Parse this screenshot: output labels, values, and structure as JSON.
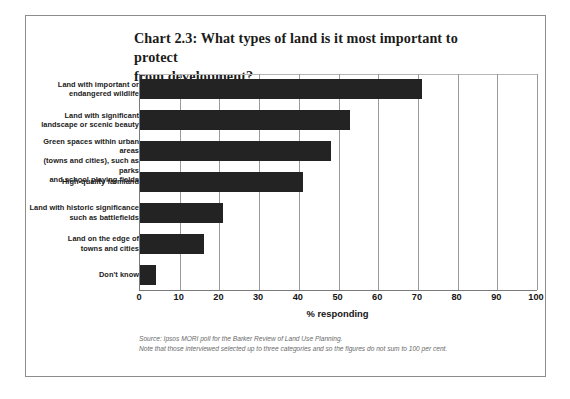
{
  "chart_data": {
    "type": "bar",
    "orientation": "horizontal",
    "title": "Chart 2.3: What types of land is it most important to protect from development?",
    "title_line1": "Chart 2.3: What types of land is it most important to protect",
    "title_line2": "from development?",
    "xlabel": "% responding",
    "ylabel": "",
    "xlim": [
      0,
      100
    ],
    "xticks": [
      0,
      10,
      20,
      30,
      40,
      50,
      60,
      70,
      80,
      90,
      100
    ],
    "xticklabels": [
      "0",
      "10",
      "20",
      "30",
      "40",
      "50",
      "60",
      "70",
      "80",
      "90",
      "100"
    ],
    "grid": "vertical",
    "legend": "none",
    "bar_color": "#232323",
    "categories": [
      "Land with important or endangered wildlife",
      "Land with significant landscape or scenic beauty",
      "Green spaces within urban areas (towns and cities), such as parks and school playing fields",
      "High-quality farmland",
      "Land with historic significance such as battlefields",
      "Land on the edge of towns and cities",
      "Don't know"
    ],
    "category_lines": [
      [
        "Land with important or",
        "endangered wildlife"
      ],
      [
        "Land with significant",
        "landscape or scenic beauty"
      ],
      [
        "Green spaces within urban areas",
        "(towns and cities), such as parks",
        "and school playing fields"
      ],
      [
        "High-quality farmland"
      ],
      [
        "Land with historic significance",
        "such as battlefields"
      ],
      [
        "Land on the edge of",
        "towns and cities"
      ],
      [
        "Don't know"
      ]
    ],
    "values": [
      71,
      53,
      48,
      41,
      21,
      16,
      4
    ]
  },
  "footnote": {
    "source": "Source: Ipsos MORI poll for the Barker Review of Land Use Planning.",
    "note": "Note that those interviewed selected up to three categories and so the figures do not sum to 100 per cent."
  }
}
